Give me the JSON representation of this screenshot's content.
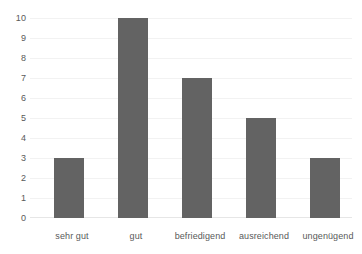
{
  "chart_data": {
    "type": "bar",
    "title": "",
    "subtitle": "",
    "xlabel": "",
    "ylabel": "",
    "categories": [
      "sehr gut",
      "gut",
      "befriedigend",
      "ausreichend",
      "ungenügend"
    ],
    "values": [
      3,
      10,
      7,
      5,
      3
    ],
    "series": [
      {
        "name": "",
        "values": [
          3,
          10,
          7,
          5,
          3
        ]
      }
    ],
    "ylim": [
      0,
      10
    ],
    "ytick_labels": [
      "10",
      "9",
      "8",
      "7",
      "6",
      "5",
      "4",
      "3",
      "2",
      "1",
      "0"
    ],
    "ytick_values": [
      10,
      9,
      8,
      7,
      6,
      5,
      4,
      3,
      2,
      1,
      0
    ],
    "ytick_step": 1,
    "grid": true,
    "grid_orientation": "horizontal",
    "legend": false,
    "legend_position": "none",
    "annotations": [],
    "data_labels": false,
    "colors": {
      "bar": "#636363",
      "gridline": "#f2f2f2",
      "axis": "#e6e6e6",
      "text": "#595959",
      "background": "#ffffff"
    }
  }
}
